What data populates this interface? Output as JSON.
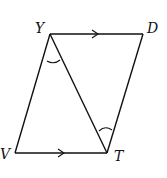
{
  "diagram": {
    "type": "parallelogram-with-diagonal",
    "points": {
      "Y": {
        "label": "Y",
        "x": 50,
        "y": 34
      },
      "D": {
        "label": "D",
        "x": 143,
        "y": 34
      },
      "V": {
        "label": "V",
        "x": 15,
        "y": 153
      },
      "T": {
        "label": "T",
        "x": 107,
        "y": 153
      }
    },
    "segments": [
      "YD",
      "DT",
      "TV",
      "VY",
      "YT"
    ],
    "parallel_marks": [
      "YD",
      "VT"
    ],
    "angle_marks": [
      "angle VYT",
      "angle YTD"
    ],
    "colors": {
      "stroke": "#111111",
      "background": "#ffffff"
    }
  }
}
